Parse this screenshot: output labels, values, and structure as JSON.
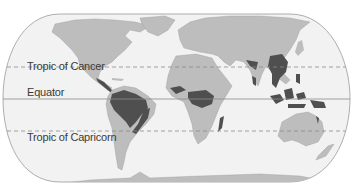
{
  "map": {
    "title": "Tropical rainforest distribution",
    "projection": "oval world map",
    "labels": {
      "tropic_of_cancer": "Tropic of Cancer",
      "equator": "Equator",
      "tropic_of_capricorn": "Tropic of Capricorn"
    },
    "colors": {
      "ocean": "#f2f2f2",
      "land": "#bdbdbd",
      "rainforest": "#4f4f4f",
      "border": "#9a9a9a",
      "lines": "#8a8a8a",
      "background": "#ffffff"
    },
    "lines": [
      {
        "name": "Tropic of Cancer",
        "style": "dashed",
        "y": 67
      },
      {
        "name": "Equator",
        "style": "solid",
        "y": 99
      },
      {
        "name": "Tropic of Capricorn",
        "style": "dashed",
        "y": 131
      }
    ],
    "legend_regions": [
      "Central America",
      "Amazon Basin",
      "Atlantic Forest",
      "Congo Basin",
      "West Africa",
      "Madagascar",
      "India Western Ghats",
      "Southeast Asia",
      "Indonesia",
      "New Guinea",
      "Northeast Australia"
    ]
  }
}
